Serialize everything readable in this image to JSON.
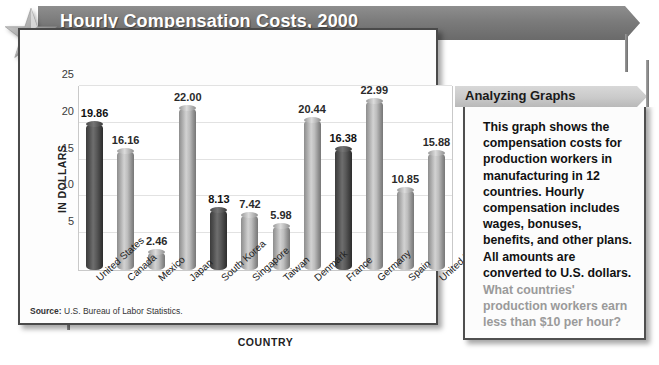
{
  "banner": {
    "title": "Hourly Compensation Costs, 2000",
    "star_icon": "star-icon"
  },
  "chart_data": {
    "type": "bar",
    "title": "Hourly Compensation Costs, 2000",
    "xlabel": "COUNTRY",
    "ylabel": "IN DOLLARS",
    "ylim": [
      0,
      25
    ],
    "yticks": [
      "5",
      "10",
      "15",
      "20",
      "25"
    ],
    "grid": true,
    "legend": "none",
    "categories": [
      "United States",
      "Canada",
      "Mexico",
      "Japan",
      "South Korea",
      "Singapore",
      "Taiwan",
      "Denmark",
      "France",
      "Germany",
      "Spain",
      "United Kingdom"
    ],
    "values": [
      19.86,
      16.16,
      2.46,
      22.0,
      8.13,
      7.42,
      5.98,
      20.44,
      16.38,
      22.99,
      10.85,
      15.88
    ],
    "value_labels": [
      "19.86",
      "16.16",
      "2.46",
      "22.00",
      "8.13",
      "7.42",
      "5.98",
      "20.44",
      "16.38",
      "22.99",
      "10.85",
      "15.88"
    ],
    "bar_shades": [
      "dark",
      "light",
      "light",
      "light",
      "dark",
      "light",
      "light",
      "light",
      "dark",
      "light",
      "light",
      "light"
    ],
    "colors": {
      "bar_dark": "#4e4e4e",
      "bar_light": "#b4b4b4",
      "grid": "#e2e2e2",
      "banner": "#7b7b7b",
      "panel_header": "#cacaca",
      "question_text": "#9a9a9a"
    }
  },
  "source": {
    "label": "Source:",
    "text": "U.S. Bureau of Labor Statistics."
  },
  "panel": {
    "header": "Analyzing Graphs",
    "body": "This graph shows the compensation costs for production workers in manufacturing in 12 countries. Hourly compensation includes wages, bonuses, benefits, and other plans. All amounts are converted to U.S. dollars.",
    "question": "What countries' production workers earn less than $10 per hour?"
  }
}
